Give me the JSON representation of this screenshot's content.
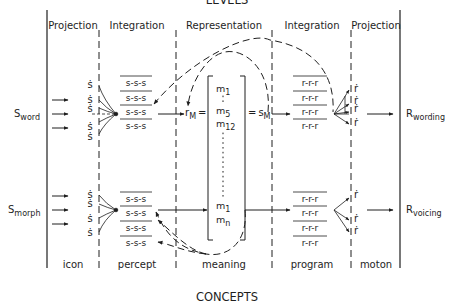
{
  "title_top": "LEVELS",
  "title_bottom": "CONCEPTS",
  "columns": [
    {
      "header": "Projection",
      "footer": "icon"
    },
    {
      "header": "Integration",
      "footer": "percept"
    },
    {
      "header": "Representation",
      "footer": "meaning"
    },
    {
      "header": "Integration",
      "footer": "program"
    },
    {
      "header": "Projection",
      "footer": "moton"
    }
  ],
  "inputs": {
    "word": {
      "symbol": "S",
      "subscript": "word"
    },
    "morph": {
      "symbol": "S",
      "subscript": "morph"
    }
  },
  "outputs": {
    "wording": {
      "symbol": "R",
      "subscript": "wording"
    },
    "voicing": {
      "symbol": "R",
      "subscript": "voicing"
    }
  },
  "icon_glyph": "ṡ",
  "moton_glyph": "ṙ",
  "percept_sequence": "s-s-s",
  "program_sequence": "r-r-r",
  "representation": {
    "left_symbol": "r",
    "left_subscript": "M",
    "left_eq": "=",
    "right_eq": "=",
    "right_symbol": "s",
    "right_subscript": "M",
    "matrix": [
      {
        "m": "m",
        "sub": "1"
      },
      {
        "m": "m",
        "sub": "5"
      },
      {
        "m": "m",
        "sub": "12"
      },
      {
        "m": "m",
        "sub": "1"
      },
      {
        "m": "m",
        "sub": "n"
      }
    ]
  },
  "colors": {
    "ink": "#1e1e1e",
    "background": "#ffffff"
  }
}
